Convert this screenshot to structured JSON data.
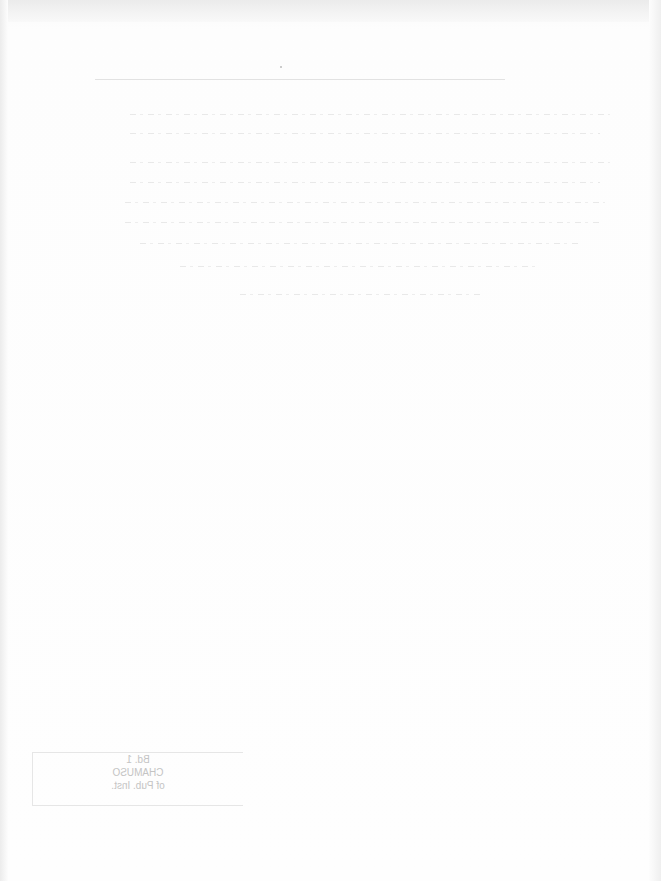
{
  "document": {
    "type": "scanned page",
    "condition": "blank page with faint bleed-through text from reverse side",
    "body_text": "",
    "stamp": {
      "lines": [
        "Bd. 1",
        "CHAMUSO",
        "of Pub. Inst."
      ],
      "mirrored": true,
      "legibility": "faint, mirrored bleed-through"
    }
  }
}
